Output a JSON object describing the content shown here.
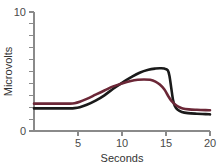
{
  "chart_data": {
    "type": "line",
    "title": "",
    "xlabel": "Seconds",
    "ylabel": "Microvolts",
    "xlim": [
      0,
      20
    ],
    "ylim": [
      0,
      10
    ],
    "grid": false,
    "legend": "none",
    "x_ticks": [
      0,
      5,
      10,
      15,
      20
    ],
    "x_tick_labels": [
      "0",
      "5",
      "10",
      "15",
      "20"
    ],
    "x_minor_ticks": [],
    "y_ticks": [
      0,
      1,
      2,
      3,
      4,
      5,
      6,
      7,
      8,
      9,
      10
    ],
    "y_tick_labels_shown": [
      "0",
      "10"
    ],
    "y_label_bottom": "0",
    "y_label_top": "10",
    "series": [
      {
        "name": "black-trace",
        "color": "#1a1a1a",
        "width": 2.6,
        "x": [
          0.0,
          1.0,
          2.0,
          3.0,
          4.0,
          4.6,
          5.2,
          6.0,
          7.0,
          8.0,
          9.0,
          10.0,
          11.0,
          12.0,
          13.0,
          13.8,
          14.3,
          14.8,
          15.2,
          15.4,
          15.6,
          15.8,
          16.0,
          16.3,
          16.8,
          17.5,
          18.5,
          19.5,
          20.0
        ],
        "y": [
          1.9,
          1.9,
          1.9,
          1.9,
          1.9,
          1.92,
          2.0,
          2.2,
          2.55,
          3.0,
          3.55,
          4.05,
          4.5,
          4.9,
          5.15,
          5.25,
          5.27,
          5.25,
          5.1,
          4.6,
          3.6,
          2.6,
          2.1,
          1.8,
          1.6,
          1.5,
          1.45,
          1.42,
          1.4
        ]
      },
      {
        "name": "maroon-trace",
        "color": "#6b2737",
        "width": 2.6,
        "x": [
          0.0,
          1.0,
          2.0,
          3.0,
          4.0,
          4.6,
          5.2,
          6.0,
          7.0,
          8.0,
          9.0,
          10.0,
          11.0,
          11.8,
          12.5,
          13.2,
          13.8,
          14.3,
          14.8,
          15.2,
          15.6,
          16.0,
          16.4,
          16.9,
          17.6,
          18.5,
          19.5,
          20.0
        ],
        "y": [
          2.3,
          2.3,
          2.3,
          2.3,
          2.3,
          2.33,
          2.45,
          2.7,
          3.05,
          3.4,
          3.75,
          4.0,
          4.2,
          4.3,
          4.33,
          4.3,
          4.15,
          3.9,
          3.5,
          3.0,
          2.55,
          2.25,
          2.05,
          1.9,
          1.82,
          1.78,
          1.75,
          1.74
        ]
      }
    ]
  },
  "colors": {
    "axis": "#8a8a8a",
    "tick_label": "#4a4a4a",
    "axis_title": "#333333",
    "background": "#ffffff"
  }
}
